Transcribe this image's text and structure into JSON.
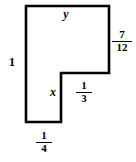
{
  "figure": {
    "type": "geometry-diagram",
    "shape_name": "l-shaped-polygon",
    "stroke_color": "#000000",
    "fill_color": "#ffffff",
    "background_color": "#ffffff",
    "vertices": [
      [
        26,
        6
      ],
      [
        109,
        6
      ],
      [
        109,
        73
      ],
      [
        61,
        73
      ],
      [
        61,
        122
      ],
      [
        26,
        122
      ]
    ],
    "labels": {
      "top_side": "y",
      "left_side": "1",
      "inner_vertical_side": "x",
      "right_side": {
        "numerator": "7",
        "denominator": "12"
      },
      "inner_horizontal_side": {
        "numerator": "1",
        "denominator": "3"
      },
      "bottom_side": {
        "numerator": "1",
        "denominator": "4"
      }
    }
  }
}
